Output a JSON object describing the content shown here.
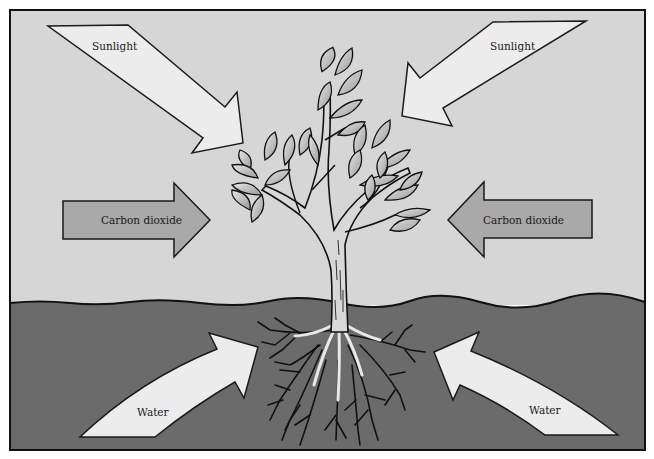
{
  "diagram": {
    "colors": {
      "sky": "#d6d6d6",
      "soil": "#6b6b6b",
      "arrow_light": "#ececec",
      "arrow_co2": "#a9a9a9",
      "outline": "#1a1a1a",
      "leaf": "#c9c9c9",
      "root": "#e8e8e8"
    },
    "labels": {
      "sunlight_left": "Sunlight",
      "sunlight_right": "Sunlight",
      "co2_left": "Carbon dioxide",
      "co2_right": "Carbon dioxide",
      "water_left": "Water",
      "water_right": "Water"
    },
    "regions": [
      "Air (above ground)",
      "Soil (below ground)"
    ]
  }
}
